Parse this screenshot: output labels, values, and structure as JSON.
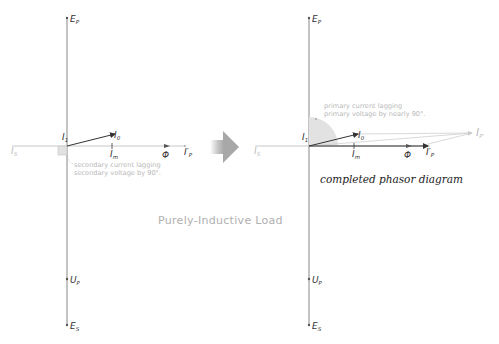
{
  "diagram": {
    "title": "Purely-Inductive Load",
    "left_panel": {
      "labels": {
        "Ep": {
          "main": "E",
          "sub": "P"
        },
        "Es": {
          "main": "E",
          "sub": "S"
        },
        "Up": {
          "main": "U",
          "sub": "P"
        },
        "I1": {
          "main": "I",
          "sub": "1"
        },
        "I0": {
          "main": "I",
          "sub": "0"
        },
        "Im": {
          "main": "I",
          "sub": "m"
        },
        "Phi": "Φ",
        "Ip_prime": {
          "main": "I",
          "sub": "P",
          "prime": "′"
        },
        "Is": {
          "main": "I",
          "sub": "S"
        }
      },
      "note_line1": "secondary current lagging",
      "note_line2": "secondary voltage by 90°."
    },
    "arrow": "transition-arrow",
    "right_panel": {
      "labels": {
        "Ep": {
          "main": "E",
          "sub": "P"
        },
        "Es": {
          "main": "E",
          "sub": "S"
        },
        "Up": {
          "main": "U",
          "sub": "P"
        },
        "I1": {
          "main": "I",
          "sub": "1"
        },
        "I0": {
          "main": "I",
          "sub": "0"
        },
        "Im": {
          "main": "I",
          "sub": "m"
        },
        "Phi": "Φ",
        "Ip_prime": {
          "main": "I",
          "sub": "P",
          "prime": "′"
        },
        "Is": {
          "main": "I",
          "sub": "S"
        },
        "Ip": {
          "main": "I",
          "sub": "P'"
        }
      },
      "note_line1": "primary current lagging",
      "note_line2": "primary voltage by nearly 90°.",
      "caption": "completed phasor diagram"
    },
    "colors": {
      "axis": "#888888",
      "vector": "#333333",
      "faint": "#c8c8c8",
      "angle_fill": "#e2e2e2",
      "arrow_gray": "#a8a8a8"
    }
  }
}
